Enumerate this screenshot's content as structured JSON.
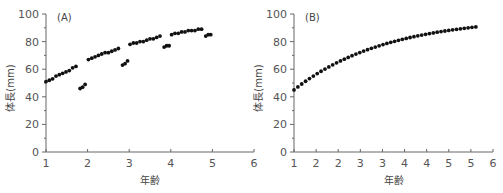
{
  "chart_data": [
    {
      "type": "scatter",
      "panel_label": "(A)",
      "title": "",
      "xlabel": "年齢",
      "ylabel": "体長(mm)",
      "xlim": [
        1,
        6
      ],
      "ylim": [
        0,
        100
      ],
      "x_ticks": [
        1,
        2,
        3,
        4,
        5,
        6
      ],
      "x_tick_labels": [
        "1",
        "2",
        "3",
        "4",
        "5",
        "6"
      ],
      "y_ticks": [
        0,
        20,
        40,
        60,
        80,
        100
      ],
      "y_tick_labels": [
        "0",
        "20",
        "40",
        "60",
        "80",
        "100"
      ],
      "y_minor_step": 10,
      "grid": false,
      "series": [
        {
          "name": "observed",
          "x": [
            1.0,
            1.08,
            1.16,
            1.24,
            1.32,
            1.4,
            1.48,
            1.56,
            1.64,
            1.72,
            1.82,
            1.88,
            1.94,
            2.02,
            2.1,
            2.18,
            2.26,
            2.34,
            2.42,
            2.5,
            2.58,
            2.66,
            2.74,
            2.84,
            2.9,
            2.96,
            3.02,
            3.1,
            3.18,
            3.26,
            3.34,
            3.42,
            3.5,
            3.58,
            3.66,
            3.74,
            3.84,
            3.9,
            3.96,
            4.02,
            4.1,
            4.18,
            4.26,
            4.34,
            4.42,
            4.5,
            4.58,
            4.66,
            4.74,
            4.84,
            4.9,
            4.96
          ],
          "y": [
            51,
            52,
            53,
            55,
            56,
            57,
            58,
            59,
            61,
            62,
            46,
            47,
            49,
            67,
            68,
            69,
            70,
            71,
            72,
            72,
            73,
            74,
            75,
            63,
            64,
            66,
            78,
            79,
            79,
            80,
            80,
            81,
            82,
            82,
            83,
            84,
            76,
            77,
            77,
            85,
            86,
            86,
            87,
            87,
            88,
            88,
            88,
            89,
            89,
            84,
            85,
            85
          ]
        }
      ]
    },
    {
      "type": "scatter",
      "panel_label": "(B)",
      "title": "",
      "xlabel": "年齢",
      "ylabel": "体長(mm)",
      "xlim": [
        1,
        5.5
      ],
      "ylim": [
        0,
        100
      ],
      "x_ticks": [
        1,
        1.5,
        2,
        2.5,
        3,
        3.5,
        4,
        4.5,
        5,
        5.5
      ],
      "x_tick_labels": [
        "1",
        "2",
        "2",
        "3",
        "3",
        "4",
        "4",
        "5",
        "5",
        "6"
      ],
      "y_ticks": [
        0,
        20,
        40,
        60,
        80,
        100
      ],
      "y_tick_labels": [
        "0",
        "20",
        "40",
        "60",
        "80",
        "100"
      ],
      "y_minor_step": 10,
      "grid": false,
      "series": [
        {
          "name": "model",
          "x_start": 1.0,
          "x_step": 0.0875,
          "count": 48,
          "y_at_start": 45,
          "y_asymptote": 98,
          "growth_k": 0.48
        }
      ]
    }
  ]
}
